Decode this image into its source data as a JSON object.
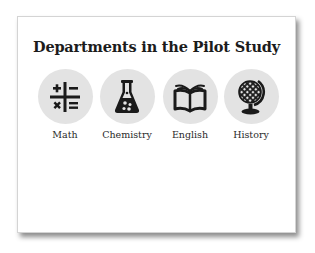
{
  "card": {
    "title": "Departments in the Pilot Study"
  },
  "departments": [
    {
      "label": "Math",
      "icon": "math-operators-icon"
    },
    {
      "label": "Chemistry",
      "icon": "flask-icon"
    },
    {
      "label": "English",
      "icon": "open-book-icon"
    },
    {
      "label": "History",
      "icon": "globe-icon"
    }
  ],
  "colors": {
    "circle_fill": "#e3e3e3",
    "icon": "#1a1a1a",
    "title": "#1c1c1c",
    "label": "#2a2a2a"
  }
}
